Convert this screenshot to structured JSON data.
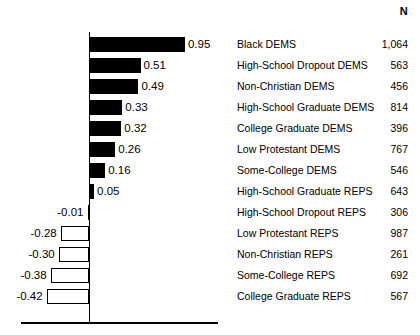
{
  "header": {
    "n_label": "N"
  },
  "chart_data": {
    "type": "bar",
    "orientation": "horizontal",
    "title": "",
    "xlabel": "",
    "ylabel": "",
    "grid": false,
    "legend": "none",
    "zero_line": true,
    "xlim": [
      -0.5,
      1.0
    ],
    "value_format": "2dp",
    "categories": [
      "Black DEMS",
      "High-School Dropout DEMS",
      "Non-Christian DEMS",
      "High-School Graduate DEMS",
      "College Graduate DEMS",
      "Low Protestant DEMS",
      "Some-College DEMS",
      "High-School Graduate REPS",
      "High-School Dropout REPS",
      "Low Protestant REPS",
      "Non-Christian REPS",
      "Some-College REPS",
      "College Graduate REPS"
    ],
    "values": [
      0.95,
      0.51,
      0.49,
      0.33,
      0.32,
      0.26,
      0.16,
      0.05,
      -0.01,
      -0.28,
      -0.3,
      -0.38,
      -0.42
    ],
    "value_labels": [
      "0.95",
      "0.51",
      "0.49",
      "0.33",
      "0.32",
      "0.26",
      "0.16",
      "0.05",
      "-0.01",
      "-0.28",
      "-0.30",
      "-0.38",
      "-0.42"
    ],
    "n_label": "N",
    "n_values": [
      "1,064",
      "563",
      "456",
      "814",
      "396",
      "767",
      "546",
      "643",
      "306",
      "987",
      "261",
      "692",
      "567"
    ],
    "bar_fill_positive": "#000000",
    "bar_fill_negative": "#ffffff",
    "bar_stroke": "#000000"
  }
}
